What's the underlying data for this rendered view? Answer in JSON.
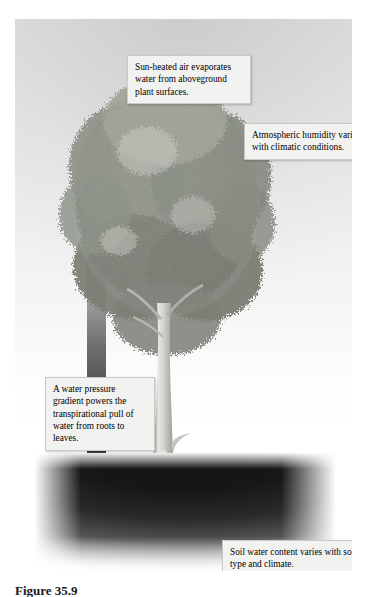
{
  "figure": {
    "caption": "Figure 35.9",
    "plate_background": "#e9e9e9",
    "soil_color": "#121212",
    "arrow_color_top": "#dcdce0",
    "arrow_color_bottom": "#3a3a3c"
  },
  "callouts": [
    {
      "id": "evaporation",
      "text": "Sun-heated air evaporates water from aboveground plant surfaces."
    },
    {
      "id": "humidity",
      "text": "Atmospheric humidity varies with climatic conditions."
    },
    {
      "id": "gradient",
      "text": "A water pressure gradient powers the transpirational pull of water from roots to leaves."
    },
    {
      "id": "soil",
      "text": "Soil water content varies with soil type and climate."
    }
  ],
  "illustration": {
    "arrow_label": "upward-water-movement-arrow",
    "tree_label": "broadleaf-tree",
    "canopy_label": "tree-canopy",
    "trunk_label": "tree-trunk",
    "roots_label": "tree-root-system",
    "soil_label": "soil-layer",
    "sky_label": "sky-background"
  }
}
